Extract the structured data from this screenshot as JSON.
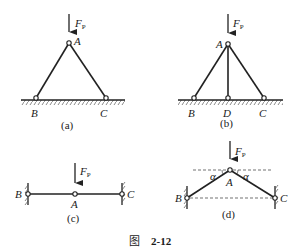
{
  "figure": {
    "caption_prefix": "图",
    "caption_number": "2-12"
  },
  "load": {
    "label_main": "F",
    "label_sub": "P"
  },
  "panels": {
    "a": {
      "caption": "(a)",
      "nodes": {
        "A": "A",
        "B": "B",
        "C": "C"
      }
    },
    "b": {
      "caption": "(b)",
      "nodes": {
        "A": "A",
        "B": "B",
        "C": "C",
        "D": "D"
      }
    },
    "c": {
      "caption": "(c)",
      "nodes": {
        "A": "A",
        "B": "B",
        "C": "C"
      }
    },
    "d": {
      "caption": "(d)",
      "nodes": {
        "A": "A",
        "B": "B",
        "C": "C"
      },
      "angle_label": "α"
    }
  },
  "colors": {
    "line": "#222222",
    "background": "#ffffff"
  }
}
